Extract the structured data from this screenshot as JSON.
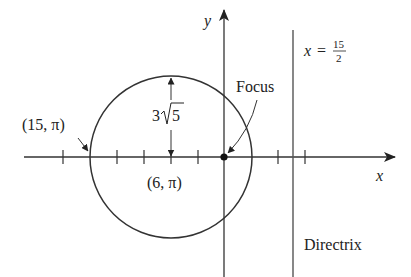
{
  "figure": {
    "type": "conic-polar-diagram",
    "curve": "ellipse (circle-like)",
    "axes": {
      "x_label": "x",
      "y_label": "y"
    },
    "labels": {
      "vertex_left": "(15, π)",
      "center": "(6, π)",
      "semi_minor": "3√5",
      "focus": "Focus",
      "directrix_eq_lhs": "x =",
      "directrix_eq_num": "15",
      "directrix_eq_den": "2",
      "directrix": "Directrix"
    },
    "colors": {
      "stroke": "#333333",
      "text": "#222222",
      "background": "#ffffff"
    }
  }
}
